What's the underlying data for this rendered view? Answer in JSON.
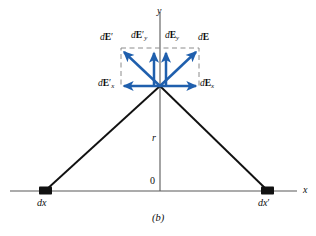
{
  "figure": {
    "caption": "(b)",
    "axes": {
      "x_label": "x",
      "y_label": "y",
      "origin_label": "0",
      "distance_label": "r"
    },
    "charge_elements": [
      {
        "name": "left-charge-element",
        "label_d": "d",
        "label_var": "x",
        "label_prime": "",
        "x": 45,
        "y": 191
      },
      {
        "name": "right-charge-element",
        "label_d": "d",
        "label_var": "x",
        "label_prime": "′",
        "x": 268,
        "y": 191
      }
    ],
    "field_point": {
      "x": 160,
      "y": 86
    },
    "vectors": [
      {
        "name": "dE-prime",
        "label_d": "d",
        "label_E": "E",
        "label_prime": "′",
        "label_sub": "",
        "tip_x": 121,
        "tip_y": 50,
        "label_x": 100,
        "label_y": 35
      },
      {
        "name": "dE-prime-y",
        "label_d": "d",
        "label_E": "E",
        "label_prime": "′",
        "label_sub": "y",
        "tip_x": 152,
        "tip_y": 49,
        "label_x": 131,
        "label_y": 33
      },
      {
        "name": "dE-y",
        "label_d": "d",
        "label_E": "E",
        "label_prime": "",
        "label_sub": "y",
        "tip_x": 166,
        "tip_y": 49,
        "label_x": 165,
        "label_y": 33
      },
      {
        "name": "dE",
        "label_d": "d",
        "label_E": "E",
        "label_prime": "",
        "label_sub": "",
        "tip_x": 199,
        "tip_y": 50,
        "label_x": 197,
        "label_y": 35
      },
      {
        "name": "dE-prime-x",
        "label_d": "d",
        "label_E": "E",
        "label_prime": "′",
        "label_sub": "x",
        "tip_x": 121,
        "tip_y": 86,
        "label_x": 99,
        "label_y": 80
      },
      {
        "name": "dE-x",
        "label_d": "d",
        "label_E": "E",
        "label_prime": "",
        "label_sub": "x",
        "tip_x": 199,
        "tip_y": 86,
        "label_x": 199,
        "label_y": 80
      }
    ],
    "colors": {
      "vector_blue": "#1f5fad",
      "line_black": "#111111",
      "axis_gray": "#585858",
      "dashed_gray": "#8c8c8c",
      "background": "#ffffff"
    }
  }
}
